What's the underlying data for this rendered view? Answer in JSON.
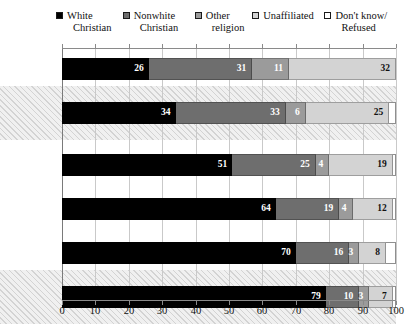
{
  "chart_data": {
    "type": "bar",
    "orientation": "horizontal",
    "stacked": true,
    "title": "",
    "subtitle": "",
    "xlabel": "",
    "ylabel": "",
    "xlim": [
      0,
      100
    ],
    "xticks": [
      0,
      10,
      20,
      30,
      40,
      50,
      60,
      70,
      80,
      90,
      100
    ],
    "xtick_labels": [
      "0",
      "10",
      "20",
      "30",
      "40",
      "50",
      "60",
      "70",
      "80",
      "90",
      "100"
    ],
    "grid": true,
    "legend_position": "top",
    "categories": [
      "18-29",
      "Obama Coalition",
      "30-49",
      "50-64",
      "65+",
      "Romney Coalition"
    ],
    "highlighted_categories": [
      "Obama Coalition",
      "Romney Coalition"
    ],
    "series": [
      {
        "name": "White Christian",
        "color": "#000000",
        "values": [
          26,
          34,
          51,
          64,
          70,
          79
        ]
      },
      {
        "name": "Nonwhite Christian",
        "color": "#6e6e6e",
        "values": [
          31,
          33,
          25,
          19,
          16,
          10
        ]
      },
      {
        "name": "Other religion",
        "color": "#9b9b9b",
        "values": [
          11,
          6,
          4,
          4,
          3,
          3
        ]
      },
      {
        "name": "Unaffiliated",
        "color": "#d3d3d3",
        "values": [
          32,
          25,
          19,
          12,
          8,
          7
        ]
      },
      {
        "name": "Don't know/ Refused",
        "color": "#ffffff",
        "values": [
          0,
          2,
          1,
          1,
          3,
          1
        ]
      }
    ]
  },
  "legend": {
    "items": [
      {
        "name": "white-christian",
        "line1": "White",
        "line2": "Christian",
        "swatch": "filled-black-square-icon"
      },
      {
        "name": "nonwhite-christian",
        "line1": "Nonwhite",
        "line2": "Christian",
        "swatch": "filled-darkgray-square-icon"
      },
      {
        "name": "other-religion",
        "line1": "Other",
        "line2": "religion",
        "swatch": "filled-midgray-square-icon"
      },
      {
        "name": "unaffiliated",
        "line1": "Unaffiliated",
        "line2": "",
        "swatch": "filled-lightgray-square-icon"
      },
      {
        "name": "dont-know-refused",
        "line1": "Don't know/",
        "line2": "Refused",
        "swatch": "empty-white-square-icon"
      }
    ]
  },
  "rows": [
    {
      "label_line1": "18-29",
      "label_line2": "",
      "bold": false,
      "highlight": false,
      "segments": [
        {
          "v": 26,
          "label": "26"
        },
        {
          "v": 31,
          "label": "31"
        },
        {
          "v": 11,
          "label": "11"
        },
        {
          "v": 32,
          "label": "32"
        },
        {
          "v": 0,
          "label": ""
        }
      ]
    },
    {
      "label_line1": "Obama",
      "label_line2": "Coalition",
      "bold": true,
      "highlight": true,
      "segments": [
        {
          "v": 34,
          "label": "34"
        },
        {
          "v": 33,
          "label": "33"
        },
        {
          "v": 6,
          "label": "6"
        },
        {
          "v": 25,
          "label": "25"
        },
        {
          "v": 2,
          "label": ""
        }
      ]
    },
    {
      "label_line1": "30-49",
      "label_line2": "",
      "bold": false,
      "highlight": false,
      "segments": [
        {
          "v": 51,
          "label": "51"
        },
        {
          "v": 25,
          "label": "25"
        },
        {
          "v": 4,
          "label": "4"
        },
        {
          "v": 19,
          "label": "19"
        },
        {
          "v": 1,
          "label": ""
        }
      ]
    },
    {
      "label_line1": "50-64",
      "label_line2": "",
      "bold": false,
      "highlight": false,
      "segments": [
        {
          "v": 64,
          "label": "64"
        },
        {
          "v": 19,
          "label": "19"
        },
        {
          "v": 4,
          "label": "4"
        },
        {
          "v": 12,
          "label": "12"
        },
        {
          "v": 1,
          "label": ""
        }
      ]
    },
    {
      "label_line1": "65+",
      "label_line2": "",
      "bold": false,
      "highlight": false,
      "segments": [
        {
          "v": 70,
          "label": "70"
        },
        {
          "v": 16,
          "label": "16"
        },
        {
          "v": 3,
          "label": "3"
        },
        {
          "v": 8,
          "label": "8"
        },
        {
          "v": 3,
          "label": ""
        }
      ]
    },
    {
      "label_line1": "Romney",
      "label_line2": "Coalition",
      "bold": true,
      "highlight": true,
      "segments": [
        {
          "v": 79,
          "label": "79"
        },
        {
          "v": 10,
          "label": "10"
        },
        {
          "v": 3,
          "label": "3"
        },
        {
          "v": 7,
          "label": "7"
        },
        {
          "v": 1,
          "label": ""
        }
      ]
    }
  ],
  "xaxis": {
    "ticks": [
      "0",
      "10",
      "20",
      "30",
      "40",
      "50",
      "60",
      "70",
      "80",
      "90",
      "100"
    ]
  }
}
